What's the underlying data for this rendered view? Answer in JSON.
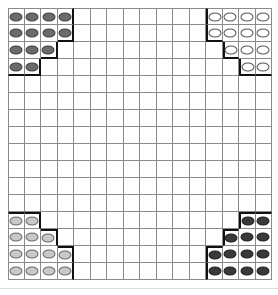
{
  "game": {
    "name": "Halma board",
    "rows": 16,
    "cols": 16
  },
  "colors": {
    "grid_line": "#8a8a8a",
    "camp_border": "#111111",
    "dark": "#6b6b6b",
    "white": "#ffffff",
    "light": "#c8c8c8",
    "black": "#3a3a3a"
  },
  "camps": [
    {
      "name": "top-left-camp",
      "color": "dark",
      "cells": [
        [
          0,
          0
        ],
        [
          0,
          1
        ],
        [
          0,
          2
        ],
        [
          0,
          3
        ],
        [
          1,
          0
        ],
        [
          1,
          1
        ],
        [
          1,
          2
        ],
        [
          1,
          3
        ],
        [
          2,
          0
        ],
        [
          2,
          1
        ],
        [
          2,
          2
        ],
        [
          3,
          0
        ],
        [
          3,
          1
        ]
      ]
    },
    {
      "name": "top-right-camp",
      "color": "white",
      "cells": [
        [
          0,
          12
        ],
        [
          0,
          13
        ],
        [
          0,
          14
        ],
        [
          0,
          15
        ],
        [
          1,
          12
        ],
        [
          1,
          13
        ],
        [
          1,
          14
        ],
        [
          1,
          15
        ],
        [
          2,
          13
        ],
        [
          2,
          14
        ],
        [
          2,
          15
        ],
        [
          3,
          14
        ],
        [
          3,
          15
        ]
      ]
    },
    {
      "name": "bottom-left-camp",
      "color": "light",
      "cells": [
        [
          12,
          0
        ],
        [
          12,
          1
        ],
        [
          13,
          0
        ],
        [
          13,
          1
        ],
        [
          13,
          2
        ],
        [
          14,
          0
        ],
        [
          14,
          1
        ],
        [
          14,
          2
        ],
        [
          14,
          3
        ],
        [
          15,
          0
        ],
        [
          15,
          1
        ],
        [
          15,
          2
        ],
        [
          15,
          3
        ]
      ]
    },
    {
      "name": "bottom-right-camp",
      "color": "black",
      "cells": [
        [
          12,
          14
        ],
        [
          12,
          15
        ],
        [
          13,
          13
        ],
        [
          13,
          14
        ],
        [
          13,
          15
        ],
        [
          14,
          12
        ],
        [
          14,
          13
        ],
        [
          14,
          14
        ],
        [
          14,
          15
        ],
        [
          15,
          12
        ],
        [
          15,
          13
        ],
        [
          15,
          14
        ],
        [
          15,
          15
        ]
      ]
    }
  ]
}
